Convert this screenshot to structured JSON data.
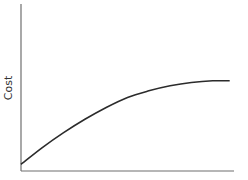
{
  "chart_data": {
    "type": "line",
    "title": "",
    "xlabel": "",
    "ylabel": "Cost",
    "xlim": [
      0,
      1
    ],
    "ylim": [
      0,
      1
    ],
    "grid": false,
    "legend": "none",
    "x_ticks": [],
    "y_ticks": [],
    "series": [
      {
        "name": "Cost",
        "x": [
          0.0,
          0.1,
          0.2,
          0.3,
          0.4,
          0.5,
          0.6,
          0.7,
          0.8,
          0.9,
          0.98
        ],
        "y": [
          0.04,
          0.14,
          0.23,
          0.31,
          0.38,
          0.44,
          0.48,
          0.51,
          0.53,
          0.54,
          0.54
        ]
      }
    ]
  }
}
